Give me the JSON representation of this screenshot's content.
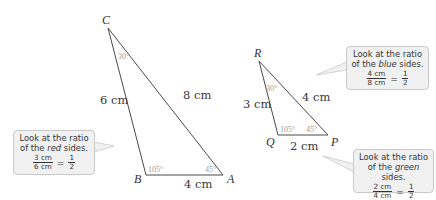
{
  "triangles": {
    "large": {
      "vertices": [
        "C",
        "B",
        "A"
      ],
      "sides": {
        "CB": "6 cm",
        "CA": "8 cm",
        "BA": "4 cm"
      },
      "angles": {
        "C": "30°",
        "B": "105°",
        "A": "45°"
      }
    },
    "small": {
      "vertices": [
        "R",
        "Q",
        "P"
      ],
      "sides": {
        "RQ": "3 cm",
        "RP": "4 cm",
        "QP": "2 cm"
      },
      "angles": {
        "R": "30°",
        "Q": "105°",
        "P": "45°"
      }
    }
  },
  "callouts": {
    "red": {
      "line1": "Look at the ratio",
      "line2_pre": "of the ",
      "line2_em": "red",
      "line2_post": " sides.",
      "num": "3 cm",
      "den": "6 cm",
      "result_num": "1",
      "result_den": "2",
      "eq": "="
    },
    "blue": {
      "line1": "Look at the ratio",
      "line2_pre": "of the ",
      "line2_em": "blue",
      "line2_post": " sides.",
      "num": "4 cm",
      "den": "8 cm",
      "result_num": "1",
      "result_den": "2",
      "eq": "="
    },
    "green": {
      "line1": "Look at the ratio",
      "line2_pre": "of the ",
      "line2_em": "green",
      "line2_post": " sides.",
      "num": "2 cm",
      "den": "4 cm",
      "result_num": "1",
      "result_den": "2",
      "eq": "="
    }
  },
  "colors": {
    "line": "#4a4a4a",
    "bubble_fill": "#f1f1f1",
    "bubble_border": "#c9c9c9",
    "angle_text": "#9a9a9a"
  }
}
